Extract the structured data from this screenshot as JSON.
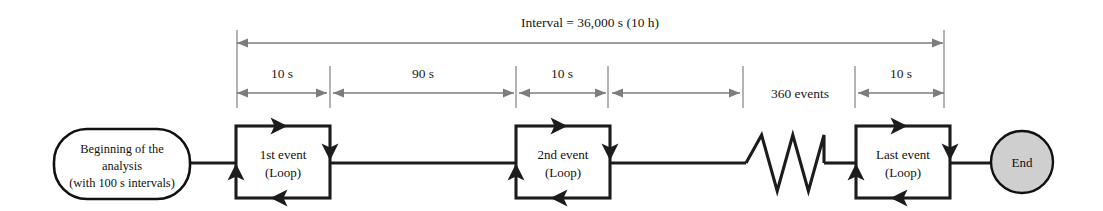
{
  "diagram": {
    "title": "Interval = 36,000 s (10 h)",
    "colors": {
      "flow_stroke": "#1c1c1c",
      "dimension_stroke": "#7d7d7d",
      "end_fill": "#cfcfcf",
      "start_fill": "#ffffff",
      "background": "#ffffff"
    },
    "dimensions": [
      {
        "id": "interval-total",
        "label": "Interval = 36,000 s (10 h)",
        "x1": 237,
        "x2": 943,
        "y": 43,
        "label_x": 590,
        "label_y": 27,
        "style": "arrow-both"
      },
      {
        "id": "span-10s-first",
        "label": "10 s",
        "x1": 237,
        "x2": 327,
        "y": 93,
        "label_x": 282,
        "label_y": 78,
        "style": "arrow-both"
      },
      {
        "id": "span-90s",
        "label": "90 s",
        "x1": 333,
        "x2": 514,
        "y": 93,
        "label_x": 423,
        "label_y": 78,
        "style": "arrow-both"
      },
      {
        "id": "span-10s-second",
        "label": "10 s",
        "x1": 519,
        "x2": 606,
        "y": 93,
        "label_x": 562,
        "label_y": 78,
        "style": "arrow-both"
      },
      {
        "id": "span-360-events",
        "label": "360 events",
        "x1": 612,
        "x2": 740,
        "y": 93,
        "label_x": 800,
        "label_y": 98,
        "style": "arrow-right-label-outside"
      },
      {
        "id": "span-10s-last",
        "label": "10 s",
        "x1": 858,
        "x2": 944,
        "y": 93,
        "label_x": 901,
        "label_y": 78,
        "style": "arrow-both"
      }
    ],
    "ticks": [
      {
        "id": "tick-start",
        "x": 237,
        "y1": 30,
        "y2": 108
      },
      {
        "id": "tick-after-first-10s",
        "x": 330,
        "y1": 66,
        "y2": 108
      },
      {
        "id": "tick-after-90s",
        "x": 516,
        "y1": 66,
        "y2": 108
      },
      {
        "id": "tick-after-second-10s",
        "x": 608,
        "y1": 66,
        "y2": 108
      },
      {
        "id": "tick-before-360-events",
        "x": 743,
        "y1": 66,
        "y2": 108
      },
      {
        "id": "tick-after-360-events",
        "x": 855,
        "y1": 66,
        "y2": 108
      },
      {
        "id": "tick-end",
        "x": 944,
        "y1": 30,
        "y2": 108
      }
    ],
    "nodes": [
      {
        "id": "start-node",
        "type": "rounded-terminator",
        "lines": [
          "Beginning of the",
          "analysis",
          "(with 100 s intervals)"
        ],
        "cx": 122,
        "cy": 164,
        "rx": 68,
        "ry": 35
      },
      {
        "id": "event-loop-1",
        "type": "loop-box",
        "lines": [
          "1st event",
          "(Loop)"
        ],
        "x": 236,
        "y": 126,
        "width": 94,
        "height": 72
      },
      {
        "id": "event-loop-2",
        "type": "loop-box",
        "lines": [
          "2nd event",
          "(Loop)"
        ],
        "x": 516,
        "y": 126,
        "width": 94,
        "height": 72
      },
      {
        "id": "event-loop-last",
        "type": "loop-box",
        "lines": [
          "Last event",
          "(Loop)"
        ],
        "x": 856,
        "y": 126,
        "width": 94,
        "height": 72
      },
      {
        "id": "end-node",
        "type": "circle-terminator",
        "lines": [
          "End"
        ],
        "cx": 1022,
        "cy": 162,
        "rx": 31,
        "ry": 31
      }
    ],
    "connectors": [
      {
        "id": "start-to-event1",
        "from": "start-node",
        "to": "event-loop-1",
        "x1": 190,
        "x2": 236,
        "y": 163
      },
      {
        "id": "event1-to-event2",
        "from": "event-loop-1",
        "to": "event-loop-2",
        "x1": 330,
        "x2": 516,
        "y": 163
      },
      {
        "id": "event2-to-break",
        "from": "event-loop-2",
        "to": "zigzag-break",
        "x1": 610,
        "x2": 746,
        "y": 163
      },
      {
        "id": "break-to-last",
        "from": "zigzag-break",
        "to": "event-loop-last",
        "x1": 824,
        "x2": 856,
        "y": 163
      },
      {
        "id": "last-to-end",
        "from": "event-loop-last",
        "to": "end-node",
        "x1": 950,
        "x2": 991,
        "y": 163
      }
    ],
    "break_symbol": {
      "id": "zigzag-break",
      "type": "zigzag",
      "x_start": 746,
      "x_end": 824,
      "y_center": 163,
      "amplitude": 28,
      "cycles": 2.5
    }
  }
}
